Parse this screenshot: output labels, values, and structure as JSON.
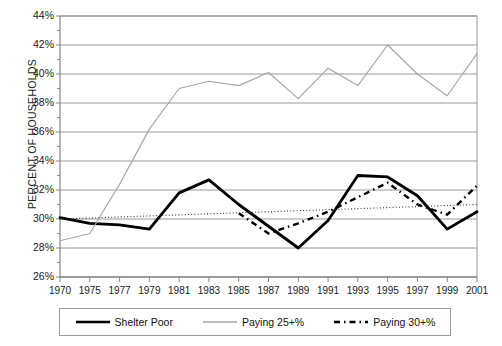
{
  "chart_data": {
    "type": "line",
    "title": "",
    "xlabel": "",
    "ylabel": "PERCENT OF HOUSEHOLDS",
    "ylim": [
      26,
      44
    ],
    "ytick_labels": [
      "26%",
      "28%",
      "30%",
      "32%",
      "34%",
      "36%",
      "38%",
      "40%",
      "42%",
      "44%"
    ],
    "ytick_values": [
      26,
      28,
      30,
      32,
      34,
      36,
      38,
      40,
      42,
      44
    ],
    "grid": "horizontal",
    "legend_position": "bottom",
    "xtick_labels": [
      "1970",
      "1975",
      "1977",
      "1979",
      "1981",
      "1983",
      "1985",
      "1987",
      "1989",
      "1991",
      "1993",
      "1995",
      "1997",
      "1999",
      "2001"
    ],
    "x": [
      1970,
      1975,
      1977,
      1979,
      1981,
      1983,
      1985,
      1987,
      1989,
      1991,
      1993,
      1995,
      1997,
      1999,
      2001
    ],
    "series": [
      {
        "name": "Shelter Poor",
        "style": "solid-thick-black",
        "color": "#000000",
        "x": [
          1970,
          1975,
          1977,
          1979,
          1981,
          1983,
          1985,
          1987,
          1989,
          1991,
          1993,
          1995,
          1997,
          1999,
          2001
        ],
        "values": [
          30.1,
          29.7,
          29.6,
          29.3,
          31.8,
          32.7,
          31.0,
          29.5,
          28.0,
          29.9,
          33.0,
          32.9,
          31.6,
          29.3,
          30.5
        ]
      },
      {
        "name": "Paying 25+%",
        "style": "solid-thin-gray",
        "color": "#a6a6a6",
        "x": [
          1970,
          1975,
          1977,
          1979,
          1981,
          1983,
          1985,
          1987,
          1989,
          1991,
          1993,
          1995,
          1997,
          1999,
          2001
        ],
        "values": [
          28.5,
          29.0,
          32.4,
          36.2,
          39.0,
          39.5,
          39.2,
          40.1,
          38.3,
          40.4,
          39.2,
          42.0,
          40.0,
          38.5,
          41.4
        ]
      },
      {
        "name": "Paying 30+%",
        "style": "dashed-black",
        "color": "#000000",
        "x": [
          1985,
          1987,
          1989,
          1991,
          1993,
          1995,
          1997,
          1999,
          2001
        ],
        "values": [
          30.4,
          29.0,
          29.7,
          30.5,
          31.5,
          32.5,
          31.0,
          30.3,
          32.3
        ]
      },
      {
        "name": "trend",
        "style": "dotted-thin-black",
        "color": "#333333",
        "x": [
          1970,
          2001
        ],
        "values": [
          30.0,
          31.0
        ]
      }
    ]
  },
  "legend": {
    "items": [
      {
        "label": "Shelter Poor"
      },
      {
        "label": "Paying 25+%"
      },
      {
        "label": "Paying 30+%"
      }
    ]
  },
  "axis": {
    "y_title": "PERCENT OF HOUSEHOLDS"
  }
}
